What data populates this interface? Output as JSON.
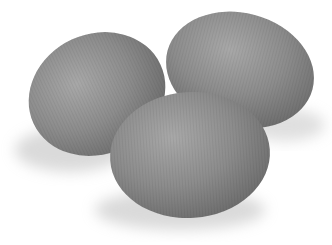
{
  "image": {
    "subject": "three gray eggs",
    "background_color": "#ffffff",
    "egg_color": "#8a8a8a",
    "egg_highlight": "#a6a6a6",
    "egg_shadow_edge": "#6e6e6e",
    "cast_shadow_color": "#d8d8d8",
    "objects": [
      {
        "name": "left-egg",
        "cx": 95,
        "cy": 93,
        "rx": 68,
        "ry": 62,
        "rotate": -20
      },
      {
        "name": "right-egg",
        "cx": 240,
        "cy": 70,
        "rx": 75,
        "ry": 56,
        "rotate": 15
      },
      {
        "name": "front-egg",
        "cx": 190,
        "cy": 153,
        "rx": 80,
        "ry": 64,
        "rotate": -5
      }
    ]
  }
}
